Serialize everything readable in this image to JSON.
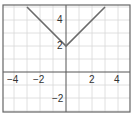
{
  "chart_data": {
    "type": "line",
    "title": "",
    "xlabel": "",
    "ylabel": "",
    "function": "y = |x| + 2",
    "series": [
      {
        "name": "y = |x| + 2",
        "x": [
          -3,
          0,
          3
        ],
        "y": [
          5,
          2,
          5
        ]
      }
    ],
    "vertex": {
      "x": 0,
      "y": 2
    },
    "x_ticks": [
      "-4",
      "-2",
      "2",
      "4"
    ],
    "y_ticks": [
      "4",
      "2",
      "-2"
    ],
    "xlim": [
      -4.9,
      4.9
    ],
    "ylim": [
      -3.1,
      5.1
    ],
    "grid": true,
    "legend": null
  },
  "labels": {
    "x_neg4": "−4",
    "x_neg2": "−2",
    "x_2": "2",
    "x_4": "4",
    "y_4": "4",
    "y_2": "2",
    "y_neg2": "−2"
  },
  "colors": {
    "grid": "#d8d8d8",
    "axis": "#555555",
    "line": "#6b6b6b",
    "frame": "#666666"
  }
}
